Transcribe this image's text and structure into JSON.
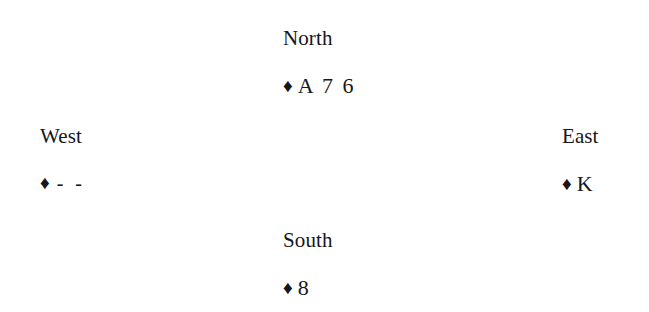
{
  "diagram": {
    "suit_symbol": "♦",
    "suit_name": "diamonds",
    "hands": {
      "north": {
        "label": "North",
        "ranks": "A 7 6"
      },
      "west": {
        "label": "West",
        "ranks": "- -"
      },
      "east": {
        "label": "East",
        "ranks": "K"
      },
      "south": {
        "label": "South",
        "ranks": "8"
      }
    }
  },
  "colors": {
    "background": "#ffffff",
    "text": "#17161a"
  }
}
